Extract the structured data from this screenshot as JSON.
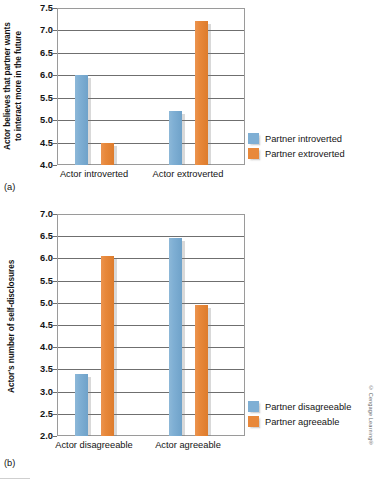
{
  "figure": {
    "credit": "© Cengage Learning®",
    "panels": [
      {
        "id": "a",
        "label": "(a)",
        "legend_position": "right"
      },
      {
        "id": "b",
        "label": "(b)",
        "legend_position": "right"
      }
    ]
  },
  "chart_data": [
    {
      "type": "bar",
      "panel": "a",
      "title": "",
      "xlabel": "",
      "ylabel": "Actor believes that partner wants\nto interact more in the future",
      "categories": [
        "Actor introverted",
        "Actor extroverted"
      ],
      "series": [
        {
          "name": "Partner introverted",
          "color": "#7fafd4",
          "values": [
            6.0,
            5.2
          ]
        },
        {
          "name": "Partner extroverted",
          "color": "#e8883a",
          "values": [
            4.5,
            7.2
          ]
        }
      ],
      "ylim": [
        4.0,
        7.5
      ],
      "ytick_step": 0.5,
      "yticks": [
        "7.5",
        "7.0",
        "6.5",
        "6.0",
        "5.5",
        "5.0",
        "4.5",
        "4.0"
      ],
      "grid": true,
      "legend": [
        "Partner introverted",
        "Partner extroverted"
      ]
    },
    {
      "type": "bar",
      "panel": "b",
      "title": "",
      "xlabel": "",
      "ylabel": "Actor's number of self-disclosures",
      "categories": [
        "Actor disagreeable",
        "Actor agreeable"
      ],
      "series": [
        {
          "name": "Partner disagreeable",
          "color": "#7fafd4",
          "values": [
            3.4,
            6.45
          ]
        },
        {
          "name": "Partner agreeable",
          "color": "#e8883a",
          "values": [
            6.05,
            4.95
          ]
        }
      ],
      "ylim": [
        2.0,
        7.0
      ],
      "ytick_step": 0.5,
      "yticks": [
        "7.0",
        "6.5",
        "6.0",
        "5.5",
        "5.0",
        "4.5",
        "4.0",
        "3.5",
        "3.0",
        "2.5",
        "2.0"
      ],
      "grid": true,
      "legend": [
        "Partner disagreeable",
        "Partner agreeable"
      ]
    }
  ]
}
